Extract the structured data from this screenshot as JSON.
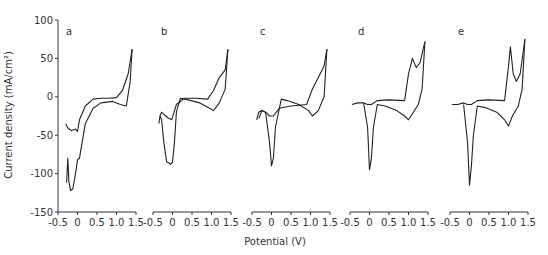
{
  "chart_data": {
    "type": "line",
    "title": "",
    "xlabel": "Potential (V)",
    "ylabel": "Current density (mA/cm²)",
    "ylim": [
      -150,
      100
    ],
    "y_ticks": [
      "100",
      "50",
      "0",
      "-50",
      "-100",
      "-150"
    ],
    "y_tick_values": [
      100,
      50,
      0,
      -50,
      -100,
      -150
    ],
    "xlim": [
      -0.5,
      1.5
    ],
    "x_ticks": [
      "-0.5",
      "0",
      "0.5",
      "1.0",
      "1.5"
    ],
    "x_tick_values": [
      -0.5,
      0,
      0.5,
      1.0,
      1.5
    ],
    "grid": false,
    "legend": null,
    "panels": [
      {
        "label": "a",
        "series": [
          {
            "name": "anodic sweep",
            "x": [
              -0.3,
              -0.28,
              -0.22,
              -0.15,
              -0.05,
              0.0,
              0.05,
              0.2,
              0.4,
              0.6,
              0.8,
              1.0,
              1.15,
              1.3,
              1.4
            ],
            "y": [
              -35,
              -38,
              -42,
              -44,
              -42,
              -45,
              -30,
              -12,
              -3,
              -2,
              -2,
              -1,
              8,
              30,
              62
            ]
          },
          {
            "name": "cathodic sweep",
            "x": [
              1.4,
              1.35,
              1.25,
              1.1,
              0.9,
              0.6,
              0.4,
              0.2,
              0.1,
              0.05,
              0.0,
              -0.05,
              -0.12,
              -0.18,
              -0.22,
              -0.25,
              -0.28
            ],
            "y": [
              62,
              20,
              -12,
              -10,
              -6,
              -8,
              -15,
              -35,
              -65,
              -80,
              -82,
              -100,
              -120,
              -122,
              -110,
              -80,
              -112
            ]
          }
        ]
      },
      {
        "label": "b",
        "series": [
          {
            "name": "anodic sweep",
            "x": [
              -0.35,
              -0.32,
              -0.28,
              -0.2,
              -0.1,
              -0.02,
              0.1,
              0.3,
              0.6,
              0.9,
              1.05,
              1.2,
              1.35,
              1.42
            ],
            "y": [
              -35,
              -25,
              -20,
              -24,
              -28,
              -30,
              -10,
              -2,
              -2,
              -3,
              8,
              25,
              35,
              62
            ]
          },
          {
            "name": "cathodic sweep",
            "x": [
              1.42,
              1.35,
              1.2,
              1.05,
              0.95,
              0.7,
              0.4,
              0.2,
              0.1,
              0.05,
              0.0,
              -0.05,
              -0.1,
              -0.15,
              -0.22,
              -0.28,
              -0.32
            ],
            "y": [
              62,
              10,
              -8,
              -18,
              -15,
              -8,
              -4,
              -2,
              -20,
              -60,
              -85,
              -88,
              -86,
              -85,
              -60,
              -30,
              -25
            ]
          }
        ]
      },
      {
        "label": "c",
        "series": [
          {
            "name": "anodic sweep",
            "x": [
              -0.38,
              -0.33,
              -0.25,
              -0.15,
              -0.05,
              0.05,
              0.2,
              0.5,
              0.9,
              1.05,
              1.2,
              1.35,
              1.42
            ],
            "y": [
              -30,
              -20,
              -18,
              -20,
              -25,
              -25,
              -15,
              -12,
              -10,
              10,
              25,
              40,
              62
            ]
          },
          {
            "name": "cathodic sweep",
            "x": [
              1.42,
              1.35,
              1.2,
              1.05,
              0.95,
              0.7,
              0.4,
              0.25,
              0.1,
              0.05,
              0.0,
              -0.05,
              -0.15,
              -0.25,
              -0.32
            ],
            "y": [
              62,
              0,
              -18,
              -25,
              -18,
              -10,
              -5,
              -3,
              -40,
              -80,
              -90,
              -60,
              -20,
              -18,
              -28
            ]
          }
        ]
      },
      {
        "label": "d",
        "series": [
          {
            "name": "anodic sweep",
            "x": [
              -0.45,
              -0.3,
              -0.15,
              -0.05,
              0.05,
              0.2,
              0.5,
              0.9,
              1.0,
              1.1,
              1.2,
              1.3,
              1.42
            ],
            "y": [
              -10,
              -8,
              -8,
              -10,
              -10,
              -5,
              -4,
              -5,
              30,
              50,
              38,
              45,
              72
            ]
          },
          {
            "name": "cathodic sweep",
            "x": [
              1.42,
              1.35,
              1.25,
              1.1,
              1.0,
              0.9,
              0.7,
              0.4,
              0.2,
              0.1,
              0.05,
              0.0,
              -0.05,
              -0.15
            ],
            "y": [
              72,
              10,
              -10,
              -22,
              -30,
              -25,
              -18,
              -12,
              -10,
              -40,
              -80,
              -95,
              -40,
              -8
            ]
          }
        ]
      },
      {
        "label": "e",
        "series": [
          {
            "name": "anodic sweep",
            "x": [
              -0.45,
              -0.3,
              -0.15,
              -0.05,
              0.05,
              0.2,
              0.5,
              0.9,
              1.0,
              1.05,
              1.12,
              1.2,
              1.3,
              1.42
            ],
            "y": [
              -10,
              -10,
              -8,
              -10,
              -10,
              -5,
              -4,
              -5,
              40,
              65,
              30,
              20,
              30,
              75
            ]
          },
          {
            "name": "cathodic sweep",
            "x": [
              1.42,
              1.35,
              1.25,
              1.1,
              1.0,
              0.9,
              0.7,
              0.4,
              0.2,
              0.1,
              0.05,
              0.0,
              -0.05,
              -0.15
            ],
            "y": [
              75,
              10,
              -12,
              -25,
              -38,
              -30,
              -20,
              -14,
              -12,
              -50,
              -90,
              -115,
              -60,
              -10
            ]
          }
        ]
      }
    ]
  }
}
